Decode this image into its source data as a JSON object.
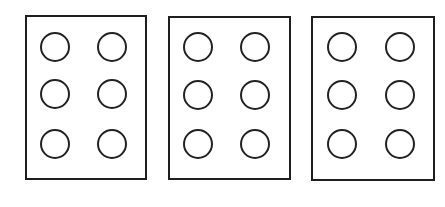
{
  "figure": {
    "cells": [
      {
        "id": "cell-1",
        "box": {
          "left": 25,
          "top": 15,
          "width": 122,
          "height": 165
        },
        "dots": [
          {
            "n": 1,
            "row": 1,
            "col": 1,
            "filled": false
          },
          {
            "n": 4,
            "row": 1,
            "col": 2,
            "filled": false
          },
          {
            "n": 2,
            "row": 2,
            "col": 1,
            "filled": false
          },
          {
            "n": 5,
            "row": 2,
            "col": 2,
            "filled": false
          },
          {
            "n": 3,
            "row": 3,
            "col": 1,
            "filled": false
          },
          {
            "n": 6,
            "row": 3,
            "col": 2,
            "filled": false
          }
        ]
      },
      {
        "id": "cell-2",
        "box": {
          "left": 168,
          "top": 16,
          "width": 123,
          "height": 164
        },
        "dots": [
          {
            "n": 1,
            "row": 1,
            "col": 1,
            "filled": false
          },
          {
            "n": 4,
            "row": 1,
            "col": 2,
            "filled": false
          },
          {
            "n": 2,
            "row": 2,
            "col": 1,
            "filled": false
          },
          {
            "n": 5,
            "row": 2,
            "col": 2,
            "filled": false
          },
          {
            "n": 3,
            "row": 3,
            "col": 1,
            "filled": false
          },
          {
            "n": 6,
            "row": 3,
            "col": 2,
            "filled": false
          }
        ]
      },
      {
        "id": "cell-3",
        "box": {
          "left": 311,
          "top": 16,
          "width": 124,
          "height": 165
        },
        "dots": [
          {
            "n": 1,
            "row": 1,
            "col": 1,
            "filled": false
          },
          {
            "n": 4,
            "row": 1,
            "col": 2,
            "filled": false
          },
          {
            "n": 2,
            "row": 2,
            "col": 1,
            "filled": false
          },
          {
            "n": 5,
            "row": 2,
            "col": 2,
            "filled": false
          },
          {
            "n": 3,
            "row": 3,
            "col": 1,
            "filled": false
          },
          {
            "n": 6,
            "row": 3,
            "col": 2,
            "filled": false
          }
        ]
      }
    ],
    "colors": {
      "border": "#1f1f1f",
      "dot_outline": "#222222",
      "background": "#ffffff"
    }
  }
}
